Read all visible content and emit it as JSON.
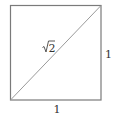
{
  "diagram": {
    "type": "unit-square-with-diagonal",
    "square": {
      "x": 10,
      "y": 5,
      "width": 91,
      "height": 95
    },
    "stroke_color": "#7a7a7a",
    "diagonal_color": "#9a9a9a",
    "labels": {
      "diagonal": "√2",
      "right_side": "1",
      "bottom_side": "1"
    }
  }
}
